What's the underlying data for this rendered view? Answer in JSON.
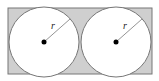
{
  "diagram": {
    "rectangle": {
      "x": 8,
      "y": 8,
      "width": 144,
      "height": 66,
      "fill": "#cfcfcf",
      "stroke": "#777777"
    },
    "circles": [
      {
        "cx": 44,
        "cy": 42,
        "r": 35,
        "fill": "#ffffff",
        "stroke": "#777777",
        "radius_label": "r",
        "label_x": 51,
        "label_y": 29
      },
      {
        "cx": 116,
        "cy": 42,
        "r": 35,
        "fill": "#ffffff",
        "stroke": "#777777",
        "radius_label": "r",
        "label_x": 123,
        "label_y": 29
      }
    ]
  }
}
